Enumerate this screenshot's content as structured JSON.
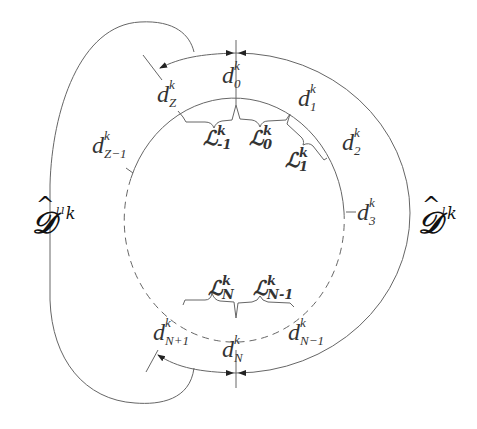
{
  "diagram": {
    "colors": {
      "line": "#555555",
      "text": "#333333"
    },
    "outer_labels": {
      "right": {
        "main": "𝒟",
        "hat": "^",
        "sup": "ˡk"
      },
      "left": {
        "main": "𝒟",
        "hat": "^",
        "sup": "ˡˡk"
      }
    },
    "nodes": [
      {
        "id": "d0",
        "base": "d",
        "sup": "k",
        "sub": "0"
      },
      {
        "id": "d1",
        "base": "d",
        "sup": "k",
        "sub": "1"
      },
      {
        "id": "d2",
        "base": "d",
        "sup": "k",
        "sub": "2"
      },
      {
        "id": "d3",
        "base": "d",
        "sup": "k",
        "sub": "3"
      },
      {
        "id": "dZ",
        "base": "d",
        "sup": "k",
        "sub": "Z"
      },
      {
        "id": "dZm1",
        "base": "d",
        "sup": "k",
        "sub": "Z−1"
      },
      {
        "id": "dN",
        "base": "d",
        "sup": "k",
        "sub": "N"
      },
      {
        "id": "dNp1",
        "base": "d",
        "sup": "k",
        "sub": "N+1"
      },
      {
        "id": "dNm1",
        "base": "d",
        "sup": "k",
        "sub": "N−1"
      }
    ],
    "segments": [
      {
        "id": "Lm1",
        "base": "ℒ",
        "sup": "k",
        "sub": "-1"
      },
      {
        "id": "L0",
        "base": "ℒ",
        "sup": "k",
        "sub": "0"
      },
      {
        "id": "L1",
        "base": "ℒ",
        "sup": "k",
        "sub": "1"
      },
      {
        "id": "LN",
        "base": "ℒ",
        "sup": "k",
        "sub": "N"
      },
      {
        "id": "LNm1",
        "base": "ℒ",
        "sup": "k",
        "sub": "N-1"
      }
    ]
  }
}
